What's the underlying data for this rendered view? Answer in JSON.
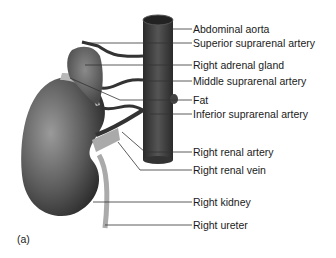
{
  "figure": {
    "panel_label": "(a)",
    "labels": [
      {
        "text": "Abdominal aorta",
        "y": 23
      },
      {
        "text": "Superior suprarenal artery",
        "y": 37
      },
      {
        "text": "Right adrenal gland",
        "y": 59
      },
      {
        "text": "Middle suprarenal artery",
        "y": 75
      },
      {
        "text": "Fat",
        "y": 94
      },
      {
        "text": "Inferior suprarenal artery",
        "y": 108
      },
      {
        "text": "Right renal artery",
        "y": 146
      },
      {
        "text": "Right renal vein",
        "y": 164
      },
      {
        "text": "Right kidney",
        "y": 196
      },
      {
        "text": "Right ureter",
        "y": 219
      }
    ]
  }
}
